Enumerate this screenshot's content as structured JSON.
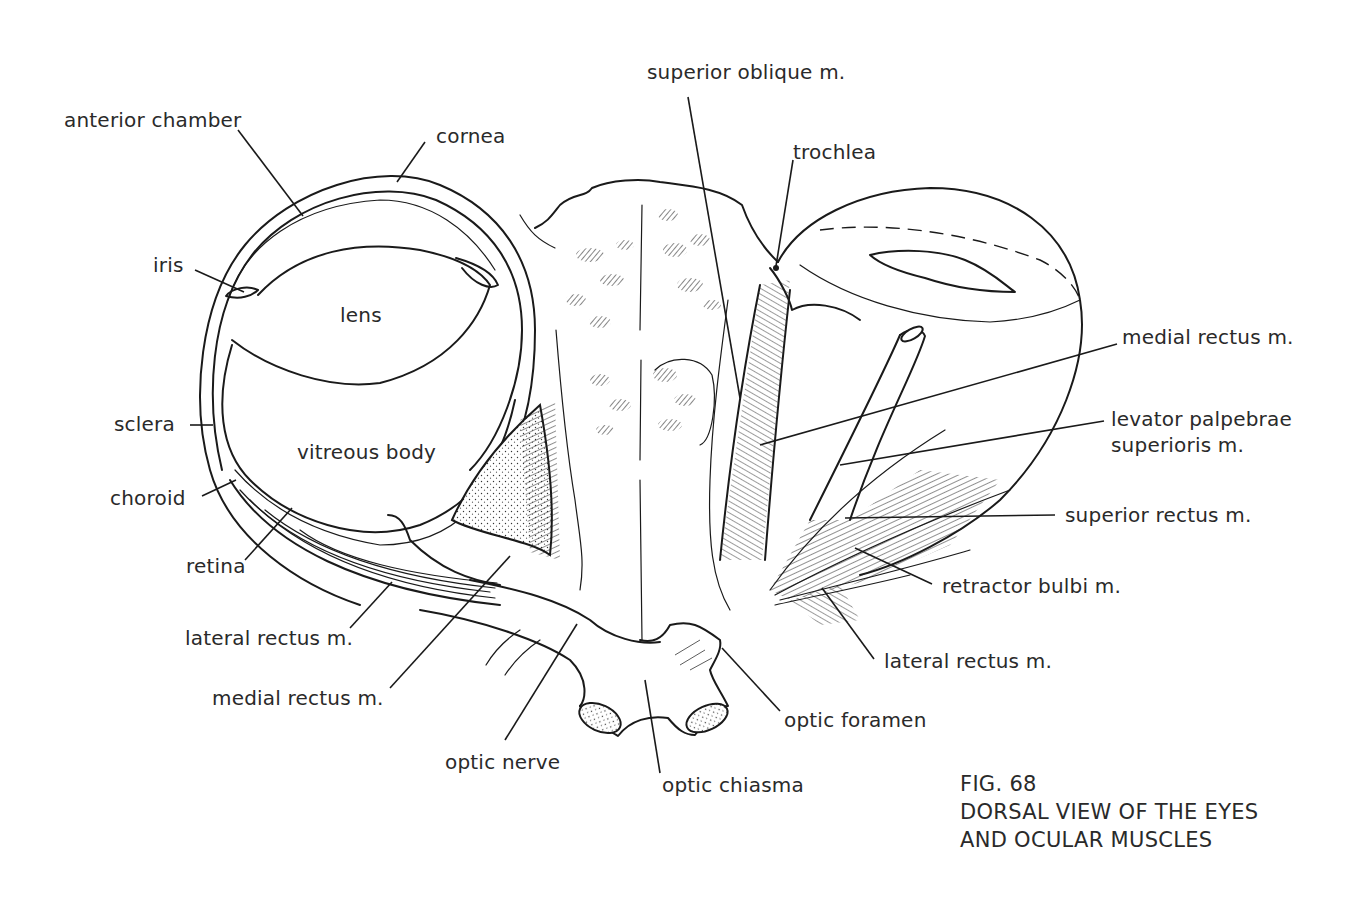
{
  "figure": {
    "number": "FIG. 68",
    "title_line1": "DORSAL VIEW OF THE EYES",
    "title_line2": "AND OCULAR MUSCLES"
  },
  "labels": {
    "left_eye": {
      "anterior_chamber": "anterior chamber",
      "cornea": "cornea",
      "iris": "iris",
      "lens": "lens",
      "sclera": "sclera",
      "vitreous_body": "vitreous body",
      "choroid": "choroid",
      "retina": "retina",
      "lateral_rectus": "lateral rectus m.",
      "medial_rectus": "medial rectus m.",
      "optic_nerve": "optic nerve"
    },
    "center": {
      "optic_chiasma": "optic chiasma",
      "optic_foramen": "optic foramen"
    },
    "right_eye": {
      "superior_oblique": "superior oblique m.",
      "trochlea": "trochlea",
      "medial_rectus": "medial rectus m.",
      "levator_line1": "levator palpebrae",
      "levator_line2": "superioris m.",
      "superior_rectus": "superior rectus m.",
      "retractor_bulbi": "retractor bulbi m.",
      "lateral_rectus": "lateral rectus m."
    }
  },
  "colors": {
    "ink": "#1a1a1a",
    "paper": "#ffffff",
    "text": "#2a2a2a"
  }
}
